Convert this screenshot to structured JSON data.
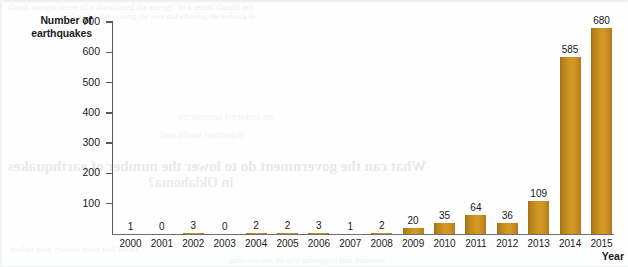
{
  "figure": {
    "width": 628,
    "height": 267,
    "background": "#fefefe"
  },
  "ghost_text": {
    "line1": "shock margin wave of a dominated the energy. In a terms should act",
    "line2": "until such a flat - casing the area and allowing the bedrock to",
    "line3": "What can the government do to lower the number of earthquakes",
    "line4": "in Oklahoma?",
    "line5": "an induced seismicity",
    "line6": "injection wells and",
    "line7": "faults that were already near failure",
    "line8": "pressure and triggering slip on pre-existing"
  },
  "chart_data": {
    "type": "bar",
    "title": "",
    "xlabel": "Year",
    "ylabel": "Number of earthquakes",
    "categories": [
      "2000",
      "2001",
      "2002",
      "2003",
      "2004",
      "2005",
      "2006",
      "2007",
      "2008",
      "2009",
      "2010",
      "2011",
      "2012",
      "2013",
      "2014",
      "2015"
    ],
    "values": [
      1,
      0,
      3,
      0,
      2,
      2,
      3,
      1,
      2,
      20,
      35,
      64,
      36,
      109,
      585,
      680
    ],
    "value_labels": [
      "1",
      "0",
      "3",
      "0",
      "2",
      "2",
      "3",
      "1",
      "2",
      "20",
      "35",
      "64",
      "36",
      "109",
      "585",
      "680"
    ],
    "ylim": [
      0,
      700
    ],
    "yticks": [
      700,
      600,
      500,
      400,
      300,
      200,
      100
    ],
    "ytick_labels": [
      "700",
      "600",
      "500",
      "400",
      "300",
      "200",
      "100"
    ],
    "grid": false,
    "legend": false,
    "bar_color": "#cf951f",
    "bar_color_dark": "#9c6f18",
    "axis_color": "#55585c",
    "text_color": "#1b1b1b"
  }
}
